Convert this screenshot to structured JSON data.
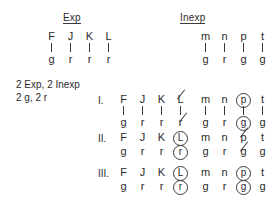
{
  "headers": {
    "exp": "Exp",
    "inexp": "Inexp"
  },
  "legend": {
    "line1": "2 Exp, 2 Inexp",
    "line2": "2 g, 2 r"
  },
  "top_table": {
    "exp": {
      "top": [
        "F",
        "J",
        "K",
        "L"
      ],
      "bottom": [
        "g",
        "r",
        "r",
        "r"
      ],
      "connectors": true
    },
    "inexp": {
      "top": [
        "m",
        "n",
        "p",
        "t"
      ],
      "bottom": [
        "g",
        "r",
        "g",
        "g"
      ],
      "connectors": true
    }
  },
  "rows": [
    {
      "numeral": "I.",
      "connectors": true,
      "exp": {
        "top": [
          {
            "text": "F",
            "mark": "none"
          },
          {
            "text": "J",
            "mark": "none"
          },
          {
            "text": "K",
            "mark": "none"
          },
          {
            "text": "L",
            "mark": "struck"
          }
        ],
        "bottom": [
          {
            "text": "g",
            "mark": "none"
          },
          {
            "text": "r",
            "mark": "none"
          },
          {
            "text": "r",
            "mark": "none"
          },
          {
            "text": "r",
            "mark": "struck"
          }
        ]
      },
      "inexp": {
        "top": [
          {
            "text": "m",
            "mark": "none"
          },
          {
            "text": "n",
            "mark": "none"
          },
          {
            "text": "p",
            "mark": "circled"
          },
          {
            "text": "t",
            "mark": "none"
          }
        ],
        "bottom": [
          {
            "text": "g",
            "mark": "none"
          },
          {
            "text": "r",
            "mark": "none"
          },
          {
            "text": "g",
            "mark": "circled"
          },
          {
            "text": "g",
            "mark": "none"
          }
        ]
      }
    },
    {
      "numeral": "II.",
      "connectors": false,
      "exp": {
        "top": [
          {
            "text": "F",
            "mark": "none"
          },
          {
            "text": "J",
            "mark": "none"
          },
          {
            "text": "K",
            "mark": "none"
          },
          {
            "text": "L",
            "mark": "circled"
          }
        ],
        "bottom": [
          {
            "text": "g",
            "mark": "none"
          },
          {
            "text": "r",
            "mark": "none"
          },
          {
            "text": "r",
            "mark": "none"
          },
          {
            "text": "r",
            "mark": "circled"
          }
        ]
      },
      "inexp": {
        "top": [
          {
            "text": "m",
            "mark": "none"
          },
          {
            "text": "n",
            "mark": "none"
          },
          {
            "text": "p",
            "mark": "struck"
          },
          {
            "text": "t",
            "mark": "none"
          }
        ],
        "bottom": [
          {
            "text": "g",
            "mark": "none"
          },
          {
            "text": "r",
            "mark": "none"
          },
          {
            "text": "g",
            "mark": "struck"
          },
          {
            "text": "g",
            "mark": "none"
          }
        ]
      }
    },
    {
      "numeral": "III.",
      "connectors": false,
      "exp": {
        "top": [
          {
            "text": "F",
            "mark": "none"
          },
          {
            "text": "J",
            "mark": "none"
          },
          {
            "text": "K",
            "mark": "none"
          },
          {
            "text": "L",
            "mark": "circled"
          }
        ],
        "bottom": [
          {
            "text": "g",
            "mark": "none"
          },
          {
            "text": "r",
            "mark": "none"
          },
          {
            "text": "r",
            "mark": "none"
          },
          {
            "text": "r",
            "mark": "circled"
          }
        ]
      },
      "inexp": {
        "top": [
          {
            "text": "m",
            "mark": "none"
          },
          {
            "text": "n",
            "mark": "none"
          },
          {
            "text": "p",
            "mark": "circled"
          },
          {
            "text": "t",
            "mark": "none"
          }
        ],
        "bottom": [
          {
            "text": "g",
            "mark": "none"
          },
          {
            "text": "r",
            "mark": "none"
          },
          {
            "text": "g",
            "mark": "circled"
          },
          {
            "text": "g",
            "mark": "none"
          }
        ]
      }
    }
  ],
  "colors": {
    "ink": "#2b2b2b",
    "background": "#ffffff"
  },
  "layout": {
    "exp_x": 42,
    "inexp_x": 196,
    "header_y": 12,
    "table_y": 30,
    "row_y": [
      93,
      131,
      166
    ]
  }
}
